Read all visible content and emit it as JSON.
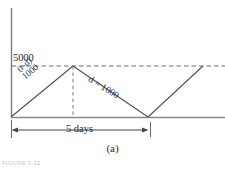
{
  "figure": {
    "caption": "(a)",
    "footer_fragment": "FIGURE 5-12",
    "axis": {
      "y_tick_label": "5000",
      "x_dimension_label": "5 days"
    },
    "annotations": {
      "rise_slope_numerator": "(r-d)",
      "rise_slope_denominator": "1000",
      "fall_slope": "d = 1000"
    },
    "colors": {
      "line": "#555555",
      "axis": "#7a7a7a",
      "dashed": "#6f6f6f",
      "text": "#2b2b2b",
      "background": "#ffffff"
    }
  },
  "chart_data": {
    "type": "line",
    "title": "(a)",
    "xlabel": "5 days",
    "ylabel": "",
    "ylim": [
      0,
      5000
    ],
    "grid": false,
    "legend": "none",
    "yticks": [
      5000
    ],
    "ytick_labels": [
      "5000"
    ],
    "reference_lines": [
      {
        "axis": "y",
        "value": 5000,
        "style": "dashed",
        "label": "5000"
      }
    ],
    "series": [
      {
        "name": "inventory",
        "x": [
          0,
          3.1,
          5.0,
          8.1
        ],
        "y": [
          0,
          5000,
          0,
          5000
        ],
        "points_px": [
          {
            "x": 11,
            "y": 117
          },
          {
            "x": 73,
            "y": 66
          },
          {
            "x": 148,
            "y": 117
          },
          {
            "x": 203,
            "y": 66
          }
        ]
      }
    ],
    "annotations": [
      {
        "text": "(r-d)/1000",
        "placement": "along-rising-segment",
        "rotation_deg": -40
      },
      {
        "text": "d = 1000",
        "placement": "along-falling-segment",
        "rotation_deg": 32
      },
      {
        "text": "5 days",
        "placement": "below-axis-dimension-line"
      }
    ]
  }
}
